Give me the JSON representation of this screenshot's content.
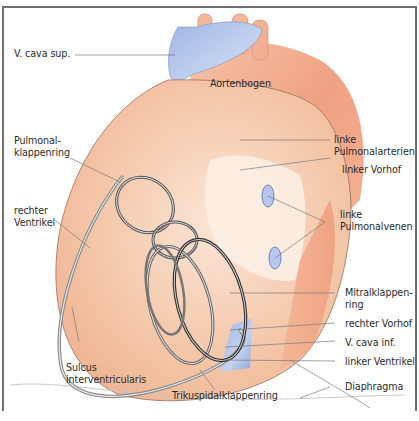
{
  "diagram": {
    "type": "anatomical-illustration",
    "colors": {
      "artery": "#f2a98c",
      "heart_tissue": "#f4c8ac",
      "vein": "#a9bde3",
      "ring": "#5a5a5a",
      "frame": "#6f6f6f",
      "leader_line": "#7a7a7a"
    },
    "labels": {
      "v_cava_sup": "V. cava sup.",
      "aortenbogen": "Aortenbogen",
      "linke_pulmonalarterien": "linke\nPulmonalarterien",
      "pulmonalklappenring": "Pulmonal-\nklappenring",
      "linker_vorhof": "linker Vorhof",
      "rechter_ventrikel": "rechter\nVentrikel",
      "linke_pulmonalvenen": "linke\nPulmonalvenen",
      "mitralklappenring": "Mitralklappen-\nring",
      "rechter_vorhof": "rechter Vorhof",
      "v_cava_inf": "V. cava inf.",
      "linker_ventrikel": "linker Ventrikel",
      "sulcus_interventricularis": "Sulcus\ninterventricularis",
      "trikuspidalklappenring": "Trikuspidalklappenring",
      "diaphragma": "Diaphragma"
    }
  }
}
